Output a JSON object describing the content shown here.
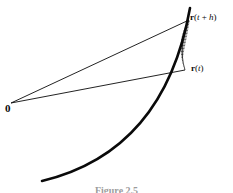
{
  "figure": {
    "caption": "Figure 2.5",
    "background_color": "#ffffff",
    "ink_color": "#0a0a0a",
    "labels": {
      "origin": "0",
      "position_vector": {
        "bold": "r",
        "open": "(",
        "variable": "t",
        "close": ")"
      },
      "displaced_vector": {
        "bold": "r",
        "open": "(",
        "variable": "t",
        "operator": " + ",
        "increment": "h",
        "close": ")"
      }
    },
    "geometry": {
      "origin_point": [
        11,
        103
      ],
      "r_t_tip": [
        185,
        70
      ],
      "r_t_plus_h_tip": [
        189,
        20
      ],
      "curve_start": [
        42,
        181
      ],
      "curve_end": [
        190,
        8
      ],
      "curve_control_1": [
        96,
        168
      ],
      "curve_control_2": [
        168,
        131
      ],
      "chord_hatch_count": 34
    },
    "elements": {
      "curve_name": "trajectory-curve",
      "vector_lower_name": "vector-r-t",
      "vector_upper_name": "vector-r-t-plus-h",
      "hatch_name": "swept-area-hatching"
    }
  }
}
